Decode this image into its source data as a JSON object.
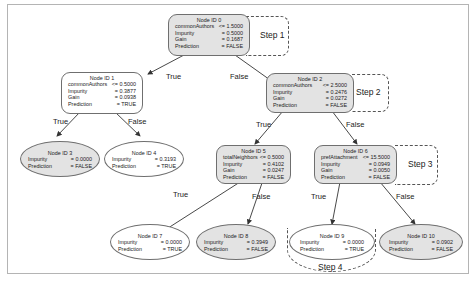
{
  "diagram": {
    "type": "decision-tree",
    "nodes": {
      "n0": {
        "title": "Node ID 0",
        "rows": [
          {
            "k": "commonAuthors",
            "v": "<= 1.5000"
          },
          {
            "k": "Impurity",
            "v": "= 0.5000"
          },
          {
            "k": "Gain",
            "v": "= 0.1687"
          },
          {
            "k": "Prediction",
            "v": "= FALSE"
          }
        ]
      },
      "n1": {
        "title": "Node ID 1",
        "rows": [
          {
            "k": "commonAuthors",
            "v": "<= 0.5000"
          },
          {
            "k": "Impurity",
            "v": "= 0.3877"
          },
          {
            "k": "Gain",
            "v": "= 0.0938"
          },
          {
            "k": "Prediction",
            "v": "= TRUE"
          }
        ]
      },
      "n2": {
        "title": "Node ID 2",
        "rows": [
          {
            "k": "commonAuthors",
            "v": "<= 2.5000"
          },
          {
            "k": "Impurity",
            "v": "= 0.2476"
          },
          {
            "k": "Gain",
            "v": "= 0.0272"
          },
          {
            "k": "Prediction",
            "v": "= FALSE"
          }
        ]
      },
      "n3": {
        "title": "Node ID 3",
        "rows": [
          {
            "k": "Impurity",
            "v": "= 0.0000"
          },
          {
            "k": "Prediction",
            "v": "= FALSE"
          }
        ]
      },
      "n4": {
        "title": "Node ID 4",
        "rows": [
          {
            "k": "Impurity",
            "v": "= 0.3193"
          },
          {
            "k": "Prediction",
            "v": "= TRUE"
          }
        ]
      },
      "n5": {
        "title": "Node ID 5",
        "rows": [
          {
            "k": "totalNeighbors",
            "v": "<= 0.5000"
          },
          {
            "k": "Impurity",
            "v": "= 0.4102"
          },
          {
            "k": "Gain",
            "v": "= 0.0247"
          },
          {
            "k": "Prediction",
            "v": "= FALSE"
          }
        ]
      },
      "n6": {
        "title": "Node ID 6",
        "rows": [
          {
            "k": "prefAttachment",
            "v": "<= 15.5000"
          },
          {
            "k": "Impurity",
            "v": "= 0.0949"
          },
          {
            "k": "Gain",
            "v": "= 0.0050"
          },
          {
            "k": "Prediction",
            "v": "= FALSE"
          }
        ]
      },
      "n7": {
        "title": "Node ID 7",
        "rows": [
          {
            "k": "Impurity",
            "v": "= 0.0000"
          },
          {
            "k": "Prediction",
            "v": "= TRUE"
          }
        ]
      },
      "n8": {
        "title": "Node ID 8",
        "rows": [
          {
            "k": "Impurity",
            "v": "= 0.3949"
          },
          {
            "k": "Prediction",
            "v": "= FALSE"
          }
        ]
      },
      "n9": {
        "title": "Node ID 9",
        "rows": [
          {
            "k": "Impurity",
            "v": "= 0.0000"
          },
          {
            "k": "Prediction",
            "v": "= TRUE"
          }
        ]
      },
      "n10": {
        "title": "Node ID 10",
        "rows": [
          {
            "k": "Impurity",
            "v": "= 0.0902"
          },
          {
            "k": "Prediction",
            "v": "= FALSE"
          }
        ]
      }
    },
    "edges": {
      "e0_1": "True",
      "e0_2": "False",
      "e1_3": "True",
      "e1_4": "False",
      "e2_5": "True",
      "e2_6": "False",
      "e5_7": "True",
      "e5_8": "False",
      "e6_9": "True",
      "e6_10": "False"
    },
    "steps": {
      "s1": "Step 1",
      "s2": "Step 2",
      "s3": "Step 3",
      "s4": "Step 4"
    },
    "colors": {
      "gray_fill": "#e3e3e3",
      "white_fill": "#ffffff",
      "border": "#6f6f6f",
      "text": "#222222"
    }
  }
}
